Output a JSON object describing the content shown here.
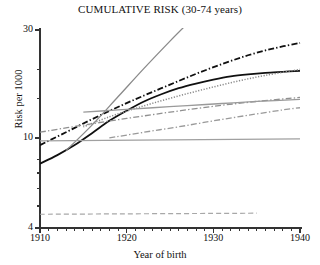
{
  "chart_data": {
    "type": "line",
    "title": "CUMULATIVE RISK (30-74 years)",
    "xlabel": "Year of birth",
    "ylabel": "Risk per 1000",
    "yscale": "log",
    "ylim": [
      4,
      30
    ],
    "xlim": [
      1910,
      1940
    ],
    "ytick_labels": [
      "30",
      "10",
      "4"
    ],
    "ytick_values": [
      30,
      10,
      4
    ],
    "yminor_ticks": [
      20,
      15,
      8,
      7,
      6,
      5
    ],
    "xtick_labels": [
      "1910",
      "1920",
      "1930",
      "1940"
    ],
    "xtick_values": [
      1910,
      1920,
      1930,
      1940
    ],
    "xminor_tick_step": 1,
    "grid": false,
    "legend": "none",
    "series": [
      {
        "name": "black-solid-curve",
        "style": "solid",
        "color": "#101010",
        "width": 1.8,
        "x": [
          1910,
          1912,
          1914,
          1916,
          1918,
          1920,
          1922,
          1924,
          1926,
          1928,
          1930,
          1932,
          1934,
          1936,
          1938,
          1940
        ],
        "y": [
          7.7,
          8.4,
          9.3,
          10.5,
          11.9,
          13.2,
          14.5,
          15.6,
          16.6,
          17.4,
          18.1,
          18.7,
          19.1,
          19.4,
          19.6,
          19.8
        ]
      },
      {
        "name": "black-dashdot-line",
        "style": "dashdot",
        "color": "#101010",
        "width": 1.8,
        "x": [
          1910,
          1913,
          1916,
          1919,
          1922,
          1925,
          1928,
          1931,
          1934,
          1937,
          1940
        ],
        "y": [
          9.3,
          10.6,
          12.1,
          13.7,
          15.4,
          17.2,
          19.2,
          21.2,
          23.2,
          24.9,
          26.3
        ]
      },
      {
        "name": "gray-steep-solid-line",
        "style": "solid",
        "color": "#8a8a8a",
        "width": 1.3,
        "x": [
          1913,
          1916,
          1919,
          1922,
          1925,
          1927
        ],
        "y": [
          8.8,
          11.4,
          15.2,
          20.3,
          26.8,
          32.0
        ]
      },
      {
        "name": "gray-dotted-curve",
        "style": "dotted",
        "color": "#8a8a8a",
        "width": 1.5,
        "x": [
          1915,
          1918,
          1921,
          1924,
          1927,
          1930,
          1933,
          1936,
          1940
        ],
        "y": [
          11.2,
          12.4,
          13.5,
          14.6,
          15.7,
          16.8,
          17.9,
          18.9,
          20.1
        ]
      },
      {
        "name": "gray-dashdot-upper-line",
        "style": "dashdot",
        "color": "#909090",
        "width": 1.3,
        "x": [
          1910,
          1915,
          1920,
          1925,
          1930,
          1935,
          1940
        ],
        "y": [
          10.6,
          11.4,
          12.2,
          13.0,
          13.8,
          14.5,
          15.1
        ]
      },
      {
        "name": "gray-solid-flat-curve",
        "style": "solid",
        "color": "#9a9a9a",
        "width": 1.3,
        "x": [
          1915,
          1919,
          1923,
          1927,
          1931,
          1935,
          1940
        ],
        "y": [
          13.0,
          13.3,
          13.6,
          13.9,
          14.2,
          14.5,
          14.8
        ]
      },
      {
        "name": "gray-dashdot-lower-line",
        "style": "dashdot",
        "color": "#9a9a9a",
        "width": 1.3,
        "x": [
          1918,
          1922,
          1926,
          1930,
          1934,
          1938,
          1940
        ],
        "y": [
          10.0,
          10.6,
          11.2,
          11.9,
          12.6,
          13.3,
          13.6
        ]
      },
      {
        "name": "gray-solid-horizontal-line",
        "style": "solid",
        "color": "#a0a0a0",
        "width": 1.2,
        "x": [
          1910,
          1940
        ],
        "y": [
          9.7,
          9.9
        ]
      },
      {
        "name": "gray-dashed-bottom-line",
        "style": "dashed",
        "color": "#a8a8a8",
        "width": 1.2,
        "x": [
          1910,
          1935
        ],
        "y": [
          4.6,
          4.65
        ]
      }
    ]
  }
}
